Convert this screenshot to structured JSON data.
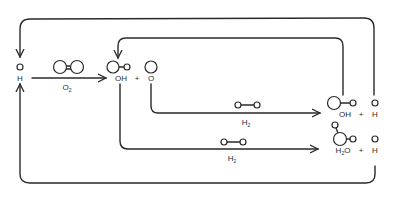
{
  "diagram": {
    "species": {
      "h_start": {
        "label": "H"
      },
      "oh_1": {
        "label": "OH"
      },
      "plus_1": {
        "label": "+"
      },
      "o_1": {
        "label": "O"
      },
      "oh_2": {
        "label": "OH"
      },
      "plus_2": {
        "label": "+"
      },
      "h_2": {
        "label": "H"
      },
      "h2o": {
        "label": "H",
        "sub": "2",
        "label_tail": "O"
      },
      "plus_3": {
        "label": "+"
      },
      "h_3": {
        "label": "H"
      }
    },
    "reagents": {
      "o2": {
        "label": "O",
        "sub": "2"
      },
      "h2_a": {
        "label": "H",
        "sub": "2"
      },
      "h2_b": {
        "label": "H",
        "sub": "2"
      }
    },
    "stroke_color": "#2a2a2a"
  }
}
